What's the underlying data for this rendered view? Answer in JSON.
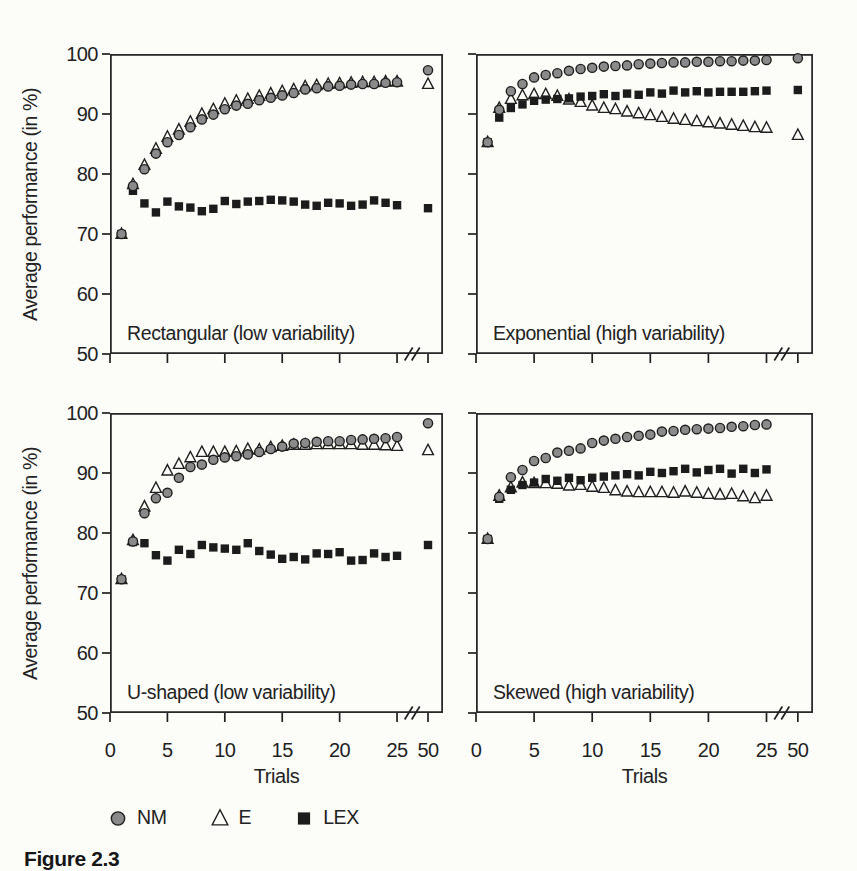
{
  "figure": {
    "caption": "Figure 2.3",
    "ylabel": "Average performance (in %)",
    "xlabel": "Trials",
    "colors": {
      "background": "#fcfcf9",
      "ink": "#1f1f1f",
      "nm_fill": "#8a8a8a",
      "e_fill": "#fcfcf9",
      "lex_fill": "#1c1c1c"
    },
    "legend": [
      {
        "label": "NM",
        "marker": "circle"
      },
      {
        "label": "E",
        "marker": "triangle"
      },
      {
        "label": "LEX",
        "marker": "square"
      }
    ]
  },
  "chart_data": [
    {
      "type": "scatter",
      "position": "top-left",
      "title": "Rectangular (low variability)",
      "xlabel": "Trials",
      "ylabel": "Average performance (in %)",
      "ylim": [
        50,
        100
      ],
      "y_ticks": [
        50,
        60,
        70,
        80,
        90,
        100
      ],
      "x_ticks": [
        0,
        5,
        10,
        15,
        20,
        25,
        50
      ],
      "x_axis_break": {
        "after": 25,
        "before": 50
      },
      "trials": [
        1,
        2,
        3,
        4,
        5,
        6,
        7,
        8,
        9,
        10,
        11,
        12,
        13,
        14,
        15,
        16,
        17,
        18,
        19,
        20,
        21,
        22,
        23,
        24,
        25,
        50
      ],
      "series": [
        {
          "name": "NM",
          "marker": "circle",
          "values": [
            70,
            78,
            80.8,
            83.4,
            85.3,
            86.5,
            87.8,
            89.1,
            89.9,
            90.8,
            91.4,
            91.7,
            92.3,
            92.7,
            93.1,
            93.5,
            94.1,
            94.3,
            94.6,
            94.7,
            94.9,
            95,
            95,
            95.2,
            95.3,
            97.3
          ]
        },
        {
          "name": "E",
          "marker": "triangle",
          "values": [
            70,
            78.3,
            81.5,
            84.2,
            86.2,
            87.4,
            88.7,
            90,
            90.8,
            91.7,
            92.2,
            92.5,
            93,
            93.4,
            93.8,
            94.1,
            94.6,
            94.8,
            95,
            95.1,
            95.2,
            95.3,
            95.3,
            95.4,
            95.4,
            95
          ]
        },
        {
          "name": "LEX",
          "marker": "square",
          "values": [
            70,
            77.2,
            75.1,
            73.6,
            75.4,
            74.6,
            74.4,
            73.8,
            74.2,
            75.5,
            75,
            75.4,
            75.5,
            75.7,
            75.6,
            75.4,
            74.9,
            74.7,
            75.2,
            75.1,
            74.7,
            74.9,
            75.6,
            75.2,
            74.8,
            74.3
          ]
        }
      ]
    },
    {
      "type": "scatter",
      "position": "top-right",
      "title": "Exponential (high variability)",
      "xlabel": "Trials",
      "ylabel": "Average performance (in %)",
      "ylim": [
        50,
        100
      ],
      "y_ticks": [
        50,
        60,
        70,
        80,
        90,
        100
      ],
      "x_ticks": [
        0,
        5,
        10,
        15,
        20,
        25,
        50
      ],
      "x_axis_break": {
        "after": 25,
        "before": 50
      },
      "trials": [
        1,
        2,
        3,
        4,
        5,
        6,
        7,
        8,
        9,
        10,
        11,
        12,
        13,
        14,
        15,
        16,
        17,
        18,
        19,
        20,
        21,
        22,
        23,
        24,
        25,
        50
      ],
      "series": [
        {
          "name": "NM",
          "marker": "circle",
          "values": [
            85.3,
            90.7,
            93.8,
            95,
            96.1,
            96.5,
            96.8,
            97.2,
            97.5,
            97.7,
            97.9,
            98,
            98.1,
            98.3,
            98.4,
            98.5,
            98.6,
            98.6,
            98.7,
            98.7,
            98.8,
            98.8,
            98.9,
            98.9,
            99,
            99.3
          ]
        },
        {
          "name": "E",
          "marker": "triangle",
          "values": [
            85.3,
            91,
            92.5,
            93.1,
            93.3,
            93.3,
            93,
            92.4,
            92,
            91.4,
            91,
            90.8,
            90.4,
            90.1,
            89.8,
            89.5,
            89.2,
            89,
            88.8,
            88.6,
            88.4,
            88.2,
            88,
            87.8,
            87.7,
            86.5
          ]
        },
        {
          "name": "LEX",
          "marker": "square",
          "values": [
            85.3,
            89.4,
            91,
            91.6,
            92.2,
            92.4,
            92.5,
            92.6,
            92.9,
            93,
            93.3,
            93,
            93.4,
            93.2,
            93.6,
            93.4,
            93.9,
            93.6,
            93.8,
            93.6,
            93.7,
            93.7,
            93.7,
            93.8,
            93.9,
            94
          ]
        }
      ]
    },
    {
      "type": "scatter",
      "position": "bottom-left",
      "title": "U-shaped (low variability)",
      "xlabel": "Trials",
      "ylabel": "Average performance (in %)",
      "ylim": [
        50,
        100
      ],
      "y_ticks": [
        50,
        60,
        70,
        80,
        90,
        100
      ],
      "x_ticks": [
        0,
        5,
        10,
        15,
        20,
        25,
        50
      ],
      "x_axis_break": {
        "after": 25,
        "before": 50
      },
      "trials": [
        1,
        2,
        3,
        4,
        5,
        6,
        7,
        8,
        9,
        10,
        11,
        12,
        13,
        14,
        15,
        16,
        17,
        18,
        19,
        20,
        21,
        22,
        23,
        24,
        25,
        50
      ],
      "series": [
        {
          "name": "NM",
          "marker": "circle",
          "values": [
            72.3,
            78.6,
            83.3,
            85.8,
            86.7,
            89.2,
            91,
            91.4,
            92.2,
            92.6,
            92.8,
            93.1,
            93.5,
            94,
            94.4,
            94.9,
            95,
            95.2,
            95.3,
            95.3,
            95.5,
            95.6,
            95.7,
            95.8,
            96,
            98.3
          ]
        },
        {
          "name": "E",
          "marker": "triangle",
          "values": [
            72.3,
            78.8,
            84.4,
            87.5,
            90.4,
            91.5,
            92.6,
            93.5,
            93.5,
            93.5,
            93.6,
            94,
            93.9,
            94.3,
            94.5,
            94.7,
            94.7,
            94.8,
            94.8,
            94.8,
            94.8,
            94.7,
            94.7,
            94.6,
            94.5,
            93.8
          ]
        },
        {
          "name": "LEX",
          "marker": "square",
          "values": [
            72.3,
            78.5,
            78.3,
            76.3,
            75.4,
            77.2,
            76.5,
            78,
            77.6,
            77.4,
            77.2,
            78.3,
            77,
            76.4,
            75.7,
            76,
            75.6,
            76.6,
            76.5,
            76.8,
            75.4,
            75.5,
            76.6,
            76,
            76.2,
            78
          ]
        }
      ]
    },
    {
      "type": "scatter",
      "position": "bottom-right",
      "title": "Skewed (high variability)",
      "xlabel": "Trials",
      "ylabel": "Average performance (in %)",
      "ylim": [
        50,
        100
      ],
      "y_ticks": [
        50,
        60,
        70,
        80,
        90,
        100
      ],
      "x_ticks": [
        0,
        5,
        10,
        15,
        20,
        25,
        50
      ],
      "x_axis_break": {
        "after": 25,
        "before": 50
      },
      "trials": [
        1,
        2,
        3,
        4,
        5,
        6,
        7,
        8,
        9,
        10,
        11,
        12,
        13,
        14,
        15,
        16,
        17,
        18,
        19,
        20,
        21,
        22,
        23,
        24,
        25
      ],
      "series": [
        {
          "name": "NM",
          "marker": "circle",
          "values": [
            79,
            86,
            89.3,
            90.5,
            92,
            92.5,
            93.4,
            93.7,
            94.1,
            95,
            95.4,
            95.7,
            96,
            96.2,
            96.4,
            96.9,
            97,
            97.2,
            97.3,
            97.4,
            97.5,
            97.7,
            97.8,
            98,
            98.1
          ]
        },
        {
          "name": "E",
          "marker": "triangle",
          "values": [
            79,
            86.2,
            87.6,
            88.4,
            88.3,
            88.3,
            88.2,
            87.9,
            88,
            87.7,
            87.5,
            87.1,
            86.9,
            86.8,
            86.8,
            86.8,
            86.7,
            86.9,
            86.7,
            86.5,
            86.4,
            86.5,
            86.1,
            85.8,
            86.2
          ]
        },
        {
          "name": "LEX",
          "marker": "square",
          "values": [
            79,
            85.7,
            87.2,
            88,
            88.4,
            89,
            88.7,
            89.2,
            88.8,
            89.2,
            89.4,
            89.6,
            89.8,
            89.6,
            90.2,
            90,
            90.3,
            90.7,
            90.1,
            90.5,
            90.7,
            89.9,
            90.7,
            90,
            90.6
          ]
        }
      ]
    }
  ]
}
